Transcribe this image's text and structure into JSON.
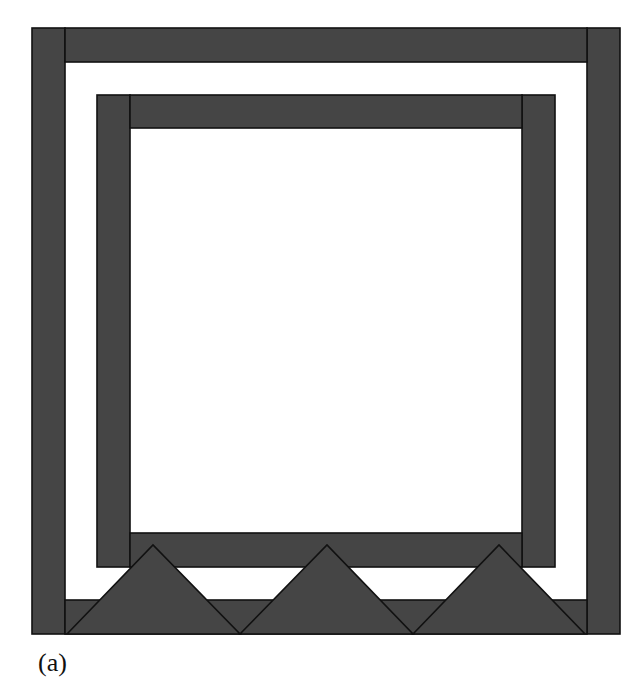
{
  "figure": {
    "label": "(a)",
    "fill_color": "#454545",
    "stroke_color": "#111111",
    "background_color": "#ffffff",
    "components": {
      "outer_frame": [
        "outer-left-bar",
        "outer-top-bar",
        "outer-right-bar",
        "outer-bottom-bar"
      ],
      "inner_frame": [
        "inner-left-bar",
        "inner-top-bar",
        "inner-right-bar",
        "inner-bottom-bar"
      ],
      "triangle_count": 3
    }
  }
}
